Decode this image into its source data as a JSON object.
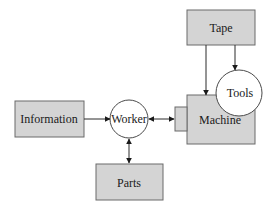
{
  "colors": {
    "box_fill": "#d4d4d4",
    "box_stroke": "#6a6a6a",
    "circle_fill": "#ffffff",
    "line": "#2a2a2a",
    "background": "#ffffff"
  },
  "nodes": {
    "tape": {
      "label": "Tape",
      "shape": "rectangle"
    },
    "tools": {
      "label": "Tools",
      "shape": "circle"
    },
    "machine": {
      "label": "Machine",
      "shape": "rectangle"
    },
    "worker": {
      "label": "Worker",
      "shape": "circle"
    },
    "information": {
      "label": "Information",
      "shape": "rectangle"
    },
    "parts": {
      "label": "Parts",
      "shape": "rectangle"
    }
  },
  "edges": [
    {
      "from": "Information",
      "to": "Worker",
      "direction": "one-way"
    },
    {
      "from": "Worker",
      "to": "Machine",
      "direction": "two-way"
    },
    {
      "from": "Worker",
      "to": "Parts",
      "direction": "two-way"
    },
    {
      "from": "Tape",
      "to": "Machine",
      "direction": "one-way"
    },
    {
      "from": "Tape",
      "to": "Tools",
      "direction": "one-way"
    }
  ]
}
